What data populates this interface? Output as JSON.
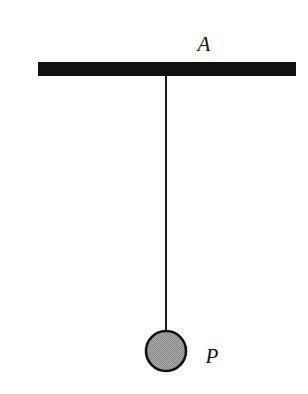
{
  "figure": {
    "kind": "physics-diagram",
    "background_color": "#ffffff",
    "width": 308,
    "height": 394
  },
  "labels": {
    "support": "A",
    "bob": "P"
  },
  "colors": {
    "ink": "#141414",
    "support_bar": "#111111",
    "string": "#1a1a1a",
    "bob_fill": "#9a9a9a",
    "bob_stroke": "#111111",
    "background": "#ffffff"
  },
  "geometry": {
    "support_bar": {
      "x": 38,
      "y": 62,
      "width": 258,
      "height": 14
    },
    "string": {
      "x": 166,
      "y_top": 76,
      "y_bottom": 333,
      "thickness": 2,
      "length": 257
    },
    "bob": {
      "cx": 166,
      "cy": 351,
      "r": 20,
      "stroke_width": 2.6
    },
    "pivot": {
      "x": 166,
      "y": 76
    }
  },
  "annotations": {
    "support_label_position": {
      "x": 204,
      "y": 44
    },
    "bob_label_position": {
      "x": 212,
      "y": 356
    }
  }
}
